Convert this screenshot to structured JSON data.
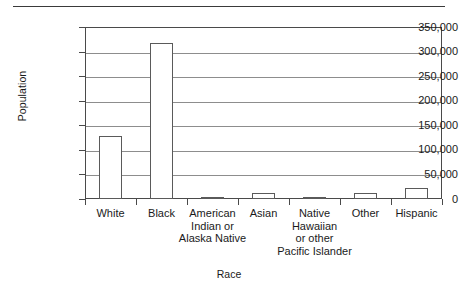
{
  "chart_data": {
    "type": "bar",
    "title": "",
    "xlabel": "Race",
    "ylabel": "Population",
    "categories": [
      "White",
      "Black",
      "American Indian or Alaska Native",
      "Asian",
      "Native Hawaiian or other Pacific Islander",
      "Other",
      "Hispanic"
    ],
    "category_lines": [
      [
        "White"
      ],
      [
        "Black"
      ],
      [
        "American",
        "Indian or",
        "Alaska Native"
      ],
      [
        "Asian"
      ],
      [
        "Native",
        "Hawaiian",
        "or other",
        "Pacific Islander"
      ],
      [
        "Other"
      ],
      [
        "Hispanic"
      ]
    ],
    "values": [
      128000,
      317000,
      5000,
      12000,
      4000,
      12000,
      22000
    ],
    "ylim": [
      0,
      350000
    ],
    "ytick_values": [
      350000,
      300000,
      250000,
      200000,
      150000,
      100000,
      50000,
      0
    ],
    "ytick_labels": [
      "350,000",
      "300,000",
      "250,000",
      "200,000",
      "150,000",
      "100,000",
      "50,000",
      "0"
    ],
    "grid": true,
    "grid_axis": "y",
    "legend": false,
    "legend_position": "none",
    "bar_fill_color": "#ffffff",
    "bar_edge_color": "#5a5a5a",
    "axis_color": "#4a4a4a",
    "gridline_color": "#8d8d8d",
    "background_color": "#ffffff",
    "text_color": "#1a1a1a"
  }
}
